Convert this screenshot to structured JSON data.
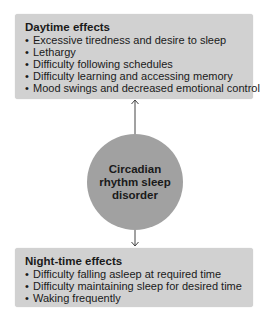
{
  "diagram": {
    "center": {
      "label": "Circadian rhythm sleep disorder"
    },
    "daytime": {
      "title": "Daytime effects",
      "items": [
        "Excessive tiredness and desire to sleep",
        "Lethargy",
        "Difficulty following schedules",
        "Difficulty learning and accessing memory",
        "Mood swings and decreased emotional control"
      ]
    },
    "nighttime": {
      "title": "Night-time effects",
      "items": [
        "Difficulty falling asleep at required time",
        "Difficulty maintaining sleep for desired time",
        "Waking frequently"
      ]
    },
    "connections": [
      {
        "from": "center",
        "to": "daytime",
        "direction": "up"
      },
      {
        "from": "center",
        "to": "nighttime",
        "direction": "down"
      }
    ],
    "colors": {
      "box_fill": "#d1d1d1",
      "circle_fill": "#a1a1a1",
      "arrow": "#444444"
    }
  }
}
